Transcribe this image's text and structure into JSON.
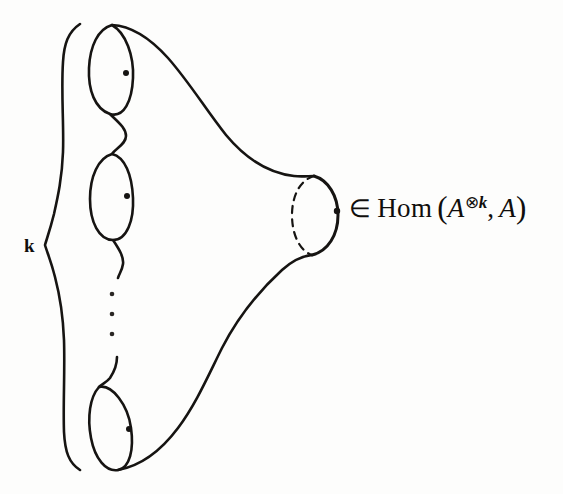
{
  "figure": {
    "kind": "hand-drawn-mathematical-diagram",
    "background_color": "#fdfdfc",
    "ink_color": "#161412"
  },
  "labels": {
    "brace_label": "k",
    "ellipsis": "⋮"
  },
  "expression": {
    "full_text": "∈ Hom (A⊗k, A)",
    "member_of": "∈",
    "hom": "Hom",
    "open_paren": "(",
    "domain_base": "A",
    "domain_sup_otimes": "⊗",
    "domain_sup_k": "k",
    "comma": ",",
    "codomain": "A",
    "close_paren": ")"
  },
  "parts": {
    "input_brace": "curly-brace",
    "handle_1": "input-boundary-circle-1",
    "handle_2": "input-boundary-circle-2",
    "handle_k": "input-boundary-circle-k",
    "output_boundary": "output-boundary-circle",
    "output_boundary_hidden_arc": "dashed-back-arc"
  }
}
